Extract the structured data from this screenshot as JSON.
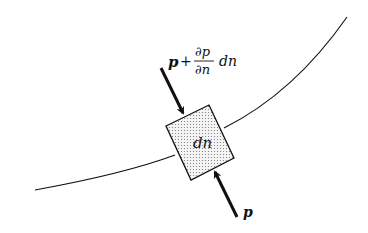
{
  "diagram": {
    "type": "fluid element across streamline",
    "labels": {
      "top_pressure_p": "p",
      "top_pressure_plus": "+",
      "top_pressure_frac_num": "∂p",
      "top_pressure_frac_den": "∂n",
      "top_pressure_dn": "dn",
      "element": "dn",
      "bottom_pressure": "p"
    },
    "colors": {
      "stroke": "#111111",
      "element_fill": "#e6e6e6",
      "background": "#ffffff"
    }
  }
}
